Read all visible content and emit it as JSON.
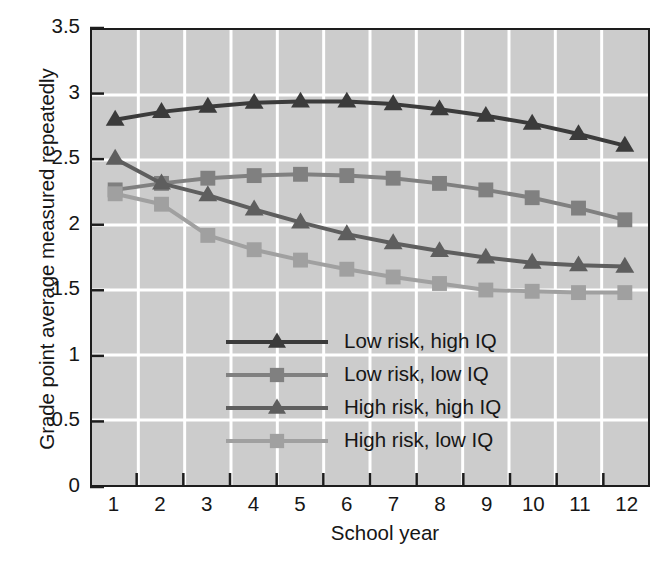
{
  "chart_data": {
    "type": "line",
    "title": "",
    "xlabel": "School year",
    "ylabel": "Grade point average measured repeatedly",
    "x": [
      1,
      2,
      3,
      4,
      5,
      6,
      7,
      8,
      9,
      10,
      11,
      12
    ],
    "xticklabels": [
      "1",
      "2",
      "3",
      "4",
      "5",
      "6",
      "7",
      "8",
      "9",
      "10",
      "11",
      "12"
    ],
    "yticklabels": [
      "0",
      "0.5",
      "1",
      "1.5",
      "2",
      "2.5",
      "3",
      "3.5"
    ],
    "ytickvalues": [
      0,
      0.5,
      1,
      1.5,
      2,
      2.5,
      3,
      3.5
    ],
    "xlim": [
      0.5,
      12.5
    ],
    "ylim": [
      0,
      3.5
    ],
    "grid": true,
    "grid_color": "#ffffff",
    "plot_background": "#cccccc",
    "legend_position": "center-left",
    "series": [
      {
        "name": "Low risk, high IQ",
        "marker": "triangle",
        "color": "#3b3b3b",
        "values": [
          2.81,
          2.87,
          2.91,
          2.94,
          2.95,
          2.95,
          2.93,
          2.89,
          2.84,
          2.78,
          2.7,
          2.61
        ]
      },
      {
        "name": "Low risk, low IQ",
        "marker": "square",
        "color": "#808080",
        "values": [
          2.27,
          2.32,
          2.36,
          2.38,
          2.39,
          2.38,
          2.36,
          2.32,
          2.27,
          2.21,
          2.13,
          2.04
        ]
      },
      {
        "name": "High risk, high IQ",
        "marker": "triangle",
        "color": "#5e5e5e",
        "values": [
          2.51,
          2.32,
          2.23,
          2.12,
          2.02,
          1.93,
          1.86,
          1.8,
          1.75,
          1.71,
          1.69,
          1.68
        ]
      },
      {
        "name": "High risk, low IQ",
        "marker": "square",
        "color": "#a0a0a0",
        "values": [
          2.24,
          2.16,
          1.92,
          1.81,
          1.73,
          1.66,
          1.6,
          1.55,
          1.5,
          1.49,
          1.48,
          1.48
        ]
      }
    ]
  },
  "legend": {
    "entries": [
      {
        "label": "Low risk, high IQ"
      },
      {
        "label": "Low risk, low IQ"
      },
      {
        "label": "High risk, high IQ"
      },
      {
        "label": "High risk, low IQ"
      }
    ]
  },
  "axes": {
    "xlabel": "School year",
    "ylabel": "Grade point average measured repeatedly"
  }
}
